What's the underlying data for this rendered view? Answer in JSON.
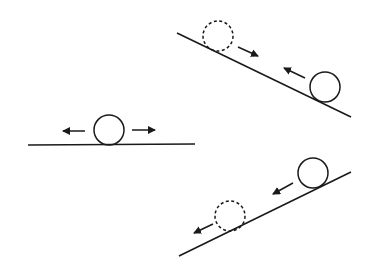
{
  "diagram": {
    "colors": {
      "stroke": "#1a1a1a",
      "background": "#ffffff"
    },
    "scenes": [
      {
        "name": "flat",
        "surface": {
          "x1": 28,
          "y1": 145,
          "x2": 195,
          "y2": 144
        },
        "balls": [
          {
            "cx": 109,
            "cy": 130,
            "r": 15,
            "style": "solid"
          }
        ],
        "arrows": [
          {
            "x1": 85,
            "y1": 131,
            "x2": 63,
            "y2": 131
          },
          {
            "x1": 132,
            "y1": 130,
            "x2": 155,
            "y2": 130
          }
        ]
      },
      {
        "name": "incline-down-right",
        "surface": {
          "x1": 177,
          "y1": 33,
          "x2": 351,
          "y2": 117
        },
        "balls": [
          {
            "cx": 218,
            "cy": 36,
            "r": 15,
            "style": "dashed"
          },
          {
            "cx": 325,
            "cy": 87,
            "r": 15,
            "style": "solid"
          }
        ],
        "arrows": [
          {
            "x1": 238,
            "y1": 47,
            "x2": 258,
            "y2": 56
          },
          {
            "x1": 305,
            "y1": 78,
            "x2": 284,
            "y2": 68
          }
        ]
      },
      {
        "name": "incline-up-right",
        "surface": {
          "x1": 179,
          "y1": 256,
          "x2": 351,
          "y2": 172
        },
        "balls": [
          {
            "cx": 313,
            "cy": 173,
            "r": 15,
            "style": "solid"
          },
          {
            "cx": 230,
            "cy": 216,
            "r": 15,
            "style": "dashed"
          }
        ],
        "arrows": [
          {
            "x1": 293,
            "y1": 183,
            "x2": 273,
            "y2": 194
          },
          {
            "x1": 213,
            "y1": 224,
            "x2": 194,
            "y2": 233
          }
        ]
      }
    ]
  }
}
